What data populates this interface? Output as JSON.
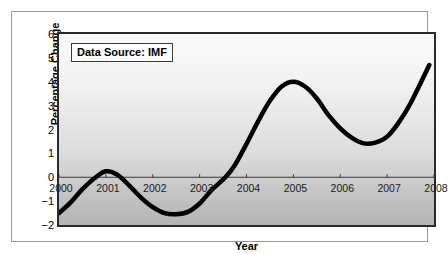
{
  "annotation": {
    "source_label": "Data Source: IMF"
  },
  "chart_data": {
    "type": "line",
    "title": "",
    "subtitle": "",
    "xlabel": "Year",
    "ylabel": "Percentage Change",
    "xlim": [
      2000,
      2008
    ],
    "ylim": [
      -2,
      6
    ],
    "xticks": [
      "2000",
      "2001",
      "2002",
      "2003",
      "2004",
      "2005",
      "2006",
      "2007",
      "2008"
    ],
    "yticks": [
      "6",
      "5",
      "4",
      "3",
      "2",
      "1",
      "0",
      "-1",
      "-2"
    ],
    "grid": false,
    "legend": null,
    "zero_line": 0,
    "annotations": [
      "Data Source: IMF"
    ],
    "line_color": "#000000",
    "line_width_px": 4.5,
    "series": [
      {
        "name": "Percentage Change",
        "x": [
          2000,
          2000.25,
          2000.5,
          2000.75,
          2001,
          2001.25,
          2001.5,
          2001.75,
          2002,
          2002.25,
          2002.5,
          2002.75,
          2003,
          2003.25,
          2003.55,
          2003.75,
          2004,
          2004.25,
          2004.5,
          2004.75,
          2005,
          2005.25,
          2005.5,
          2005.75,
          2006,
          2006.25,
          2006.5,
          2006.75,
          2007,
          2007.25,
          2007.5,
          2007.9
        ],
        "y": [
          -1.5,
          -1.05,
          -0.5,
          -0.05,
          0.25,
          0.1,
          -0.35,
          -0.85,
          -1.25,
          -1.5,
          -1.55,
          -1.45,
          -1.1,
          -0.55,
          0.0,
          0.5,
          1.4,
          2.35,
          3.2,
          3.8,
          4.0,
          3.8,
          3.3,
          2.6,
          2.05,
          1.65,
          1.42,
          1.45,
          1.7,
          2.3,
          3.1,
          4.7
        ]
      }
    ],
    "key_points": [
      {
        "label": "start",
        "x": 2000,
        "y": -1.5
      },
      {
        "label": "local-max",
        "x": 2001,
        "y": 0.25
      },
      {
        "label": "local-min",
        "x": 2002.5,
        "y": -1.55
      },
      {
        "label": "zero-crossing",
        "x": 2003.55,
        "y": 0.0
      },
      {
        "label": "local-max",
        "x": 2005,
        "y": 4.0
      },
      {
        "label": "local-min",
        "x": 2006.5,
        "y": 1.42
      },
      {
        "label": "end",
        "x": 2007.9,
        "y": 4.7
      }
    ]
  }
}
